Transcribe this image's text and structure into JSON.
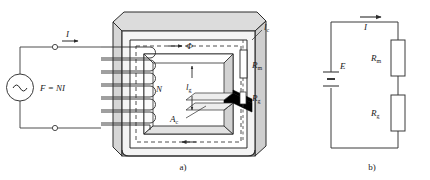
{
  "figure": {
    "panels": [
      {
        "id": "a",
        "caption": "a)",
        "title": "magnetic core with coil and air gap"
      },
      {
        "id": "b",
        "caption": "b)",
        "title": "equivalent magnetic circuit"
      }
    ]
  },
  "panel_a": {
    "source_label": "F = NI",
    "source_symbol": "~",
    "current_label": "I",
    "turns_label": "N",
    "flux_label": "Φ",
    "core_length_label": "l",
    "core_length_sub": "c",
    "gap_length_label": "l",
    "gap_length_sub": "g",
    "core_area_label": "A",
    "core_area_sub": "c",
    "reluctance_core_label": "R",
    "reluctance_core_sub": "m",
    "reluctance_gap_label": "R",
    "reluctance_gap_sub": "g",
    "caption": "a)"
  },
  "panel_b": {
    "emf_label": "E",
    "current_label": "I",
    "resistor_core_label": "R",
    "resistor_core_sub": "m",
    "resistor_gap_label": "R",
    "resistor_gap_sub": "g",
    "caption": "b)"
  },
  "colors": {
    "stroke": "#2b2b2b",
    "line": "#3a3a3a",
    "core_face_light": "#f2f2f2",
    "core_face_mid": "#dcdcdc",
    "core_face_dark": "#c8c8c8",
    "gap_fill": "#000000",
    "background": "#ffffff",
    "text": "#1a1a1a"
  }
}
